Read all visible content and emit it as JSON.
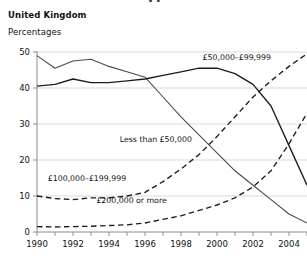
{
  "crop_title": "31",
  "header": {
    "region": "United Kingdom",
    "units": "Percentages"
  },
  "chart_data": {
    "type": "line",
    "title": "United Kingdom",
    "subtitle": "Percentages",
    "xlabel": "",
    "ylabel": "Percentages",
    "xlim": [
      1990,
      2005
    ],
    "ylim": [
      0,
      50
    ],
    "yticks": [
      0,
      10,
      20,
      30,
      40,
      50
    ],
    "xticks": [
      1990,
      1991,
      1992,
      1993,
      1994,
      1995,
      1996,
      1997,
      1998,
      1999,
      2000,
      2001,
      2002,
      2003,
      2004,
      2005
    ],
    "xtick_labels_shown": [
      1990,
      1992,
      1994,
      1996,
      1998,
      2000,
      2002,
      2004
    ],
    "grid": true,
    "legend": "inline-annotations",
    "x": [
      1990,
      1991,
      1992,
      1993,
      1994,
      1995,
      1996,
      1997,
      1998,
      1999,
      2000,
      2001,
      2002,
      2003,
      2004,
      2005
    ],
    "series": [
      {
        "name": "Less than £50,000",
        "style": "solid",
        "label_x": 1994.6,
        "label_y": 25.0,
        "values": [
          49.0,
          45.5,
          47.5,
          48.0,
          46.0,
          44.5,
          43.0,
          37.5,
          32.0,
          27.0,
          22.0,
          17.0,
          13.0,
          9.0,
          5.0,
          2.5
        ]
      },
      {
        "name": "£50,000–£99,999",
        "style": "solid",
        "label_x": 1999.2,
        "label_y": 47.8,
        "values": [
          40.5,
          41.0,
          42.5,
          41.5,
          41.5,
          42.0,
          42.5,
          43.5,
          44.5,
          45.5,
          45.5,
          44.0,
          41.0,
          35.0,
          24.0,
          13.0
        ]
      },
      {
        "name": "£100,000–£199,999",
        "style": "dashed",
        "label_x": 1990.6,
        "label_y": 14.2,
        "values": [
          10.0,
          9.3,
          9.0,
          9.5,
          9.5,
          10.0,
          11.0,
          14.0,
          17.5,
          21.5,
          26.5,
          32.0,
          37.5,
          42.0,
          46.0,
          49.5
        ]
      },
      {
        "name": "£200,000 or more",
        "style": "dashed",
        "label_x": 1993.3,
        "label_y": 8.0,
        "values": [
          1.5,
          1.4,
          1.5,
          1.6,
          1.8,
          2.0,
          2.5,
          3.5,
          4.5,
          6.0,
          7.5,
          9.5,
          12.5,
          17.0,
          24.5,
          33.0
        ]
      }
    ]
  }
}
